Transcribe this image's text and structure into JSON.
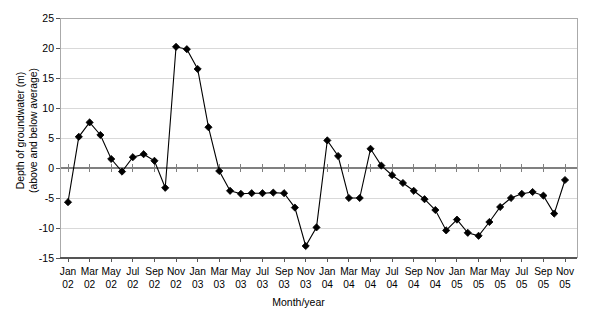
{
  "chart_data": {
    "type": "line",
    "title": "",
    "xlabel": "Month/year",
    "ylabel": "Depth of groundwater (m)\n(above and below average)",
    "ylim": [
      -15,
      25
    ],
    "yticks": [
      25,
      20,
      15,
      10,
      5,
      0,
      -5,
      -10,
      -15
    ],
    "ytick_labels": [
      "25",
      "20",
      "15",
      "10",
      "5",
      "0",
      "-5",
      "-10",
      "-15"
    ],
    "grid": true,
    "legend": "none",
    "marker": "diamond",
    "line_color": "#000000",
    "marker_color": "#000000",
    "grid_color": "#d9d9d9",
    "zero_line_color": "#808080",
    "x_tick_labels": [
      {
        "month": "Jan",
        "year": "02"
      },
      {
        "month": "Mar",
        "year": "02"
      },
      {
        "month": "May",
        "year": "02"
      },
      {
        "month": "Jul",
        "year": "02"
      },
      {
        "month": "Sep",
        "year": "02"
      },
      {
        "month": "Nov",
        "year": "02"
      },
      {
        "month": "Jan",
        "year": "03"
      },
      {
        "month": "Mar",
        "year": "03"
      },
      {
        "month": "May",
        "year": "03"
      },
      {
        "month": "Jul",
        "year": "03"
      },
      {
        "month": "Sep",
        "year": "03"
      },
      {
        "month": "Nov",
        "year": "03"
      },
      {
        "month": "Jan",
        "year": "04"
      },
      {
        "month": "Mar",
        "year": "04"
      },
      {
        "month": "May",
        "year": "04"
      },
      {
        "month": "Jul",
        "year": "04"
      },
      {
        "month": "Sep",
        "year": "04"
      },
      {
        "month": "Nov",
        "year": "04"
      },
      {
        "month": "Jan",
        "year": "05"
      },
      {
        "month": "Mar",
        "year": "05"
      },
      {
        "month": "May",
        "year": "05"
      },
      {
        "month": "Jul",
        "year": "05"
      },
      {
        "month": "Sep",
        "year": "05"
      },
      {
        "month": "Nov",
        "year": "05"
      }
    ],
    "x": [
      "Jan 02",
      "Feb 02",
      "Mar 02",
      "Apr 02",
      "May 02",
      "Jun 02",
      "Jul 02",
      "Aug 02",
      "Sep 02",
      "Oct 02",
      "Nov 02",
      "Dec 02",
      "Jan 03",
      "Feb 03",
      "Mar 03",
      "Apr 03",
      "May 03",
      "Jun 03",
      "Jul 03",
      "Aug 03",
      "Sep 03",
      "Oct 03",
      "Nov 03",
      "Dec 03",
      "Jan 04",
      "Feb 04",
      "Mar 04",
      "Apr 04",
      "May 04",
      "Jun 04",
      "Jul 04",
      "Aug 04",
      "Sep 04",
      "Oct 04",
      "Nov 04",
      "Dec 04",
      "Jan 05",
      "Feb 05",
      "Mar 05",
      "Apr 05",
      "May 05",
      "Jun 05",
      "Jul 05",
      "Aug 05",
      "Sep 05",
      "Oct 05",
      "Nov 05"
    ],
    "values": [
      -5.7,
      5.2,
      7.6,
      5.5,
      1.5,
      -0.6,
      1.8,
      2.3,
      1.2,
      -3.3,
      20.2,
      19.8,
      16.5,
      6.8,
      -0.5,
      -3.8,
      -4.3,
      -4.2,
      -4.2,
      -4.1,
      -4.2,
      -6.6,
      -13.0,
      -9.9,
      4.6,
      2.0,
      -5.0,
      -5.0,
      3.2,
      0.4,
      -1.2,
      -2.5,
      -3.8,
      -5.2,
      -7.0,
      -10.4,
      -8.6,
      -10.8,
      -11.3,
      -9.0,
      -6.5,
      -5.0,
      -4.3,
      -4.0,
      -4.6,
      -7.6,
      -2.0
    ]
  }
}
